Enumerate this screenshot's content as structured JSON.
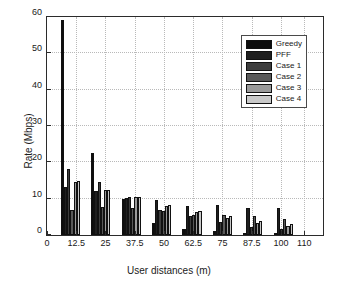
{
  "chart_data": {
    "type": "bar",
    "title": "",
    "xlabel": "User distances (m)",
    "ylabel": "Rate (Mbps)",
    "xlim": [
      0,
      118
    ],
    "ylim": [
      0,
      60
    ],
    "yticks": [
      0,
      10,
      20,
      30,
      40,
      50,
      60
    ],
    "xticks": [
      0,
      12.5,
      25,
      37.5,
      50,
      62.5,
      75,
      87.5,
      100,
      110
    ],
    "grid": true,
    "legend_position": "top-right",
    "group_centers": [
      10,
      23,
      36,
      49,
      62,
      75,
      88,
      101
    ],
    "categories": [
      "10",
      "23",
      "36",
      "49",
      "62",
      "75",
      "88",
      "101"
    ],
    "series": [
      {
        "name": "Greedy",
        "color": "#0d0d0d",
        "values": [
          59.2,
          22.5,
          9.9,
          3.3,
          1.6,
          1.1,
          0.6,
          0.3
        ]
      },
      {
        "name": "PFF",
        "color": "#1f1f1f",
        "values": [
          13.3,
          12.1,
          10.1,
          9.6,
          8.1,
          8.3,
          7.4,
          7.3
        ]
      },
      {
        "name": "Case 1",
        "color": "#3d3d3d",
        "values": [
          18.1,
          14.6,
          10.4,
          7.0,
          5.3,
          3.5,
          2.2,
          1.6
        ]
      },
      {
        "name": "Case 2",
        "color": "#595959",
        "values": [
          7.0,
          7.7,
          7.5,
          6.7,
          5.6,
          5.5,
          5.1,
          4.4
        ]
      },
      {
        "name": "Case 3",
        "color": "#9a9a9a",
        "values": [
          14.6,
          12.3,
          10.4,
          7.9,
          6.4,
          4.7,
          3.4,
          2.5
        ]
      },
      {
        "name": "Case 4",
        "color": "#c9c9c9",
        "values": [
          14.8,
          12.5,
          10.4,
          8.3,
          6.5,
          5.1,
          3.9,
          3.0
        ]
      }
    ]
  },
  "legend": {
    "items": [
      {
        "label": "Greedy"
      },
      {
        "label": "PFF"
      },
      {
        "label": "Case 1"
      },
      {
        "label": "Case 2"
      },
      {
        "label": "Case 3"
      },
      {
        "label": "Case 4"
      }
    ]
  },
  "axes": {
    "y_title": "Rate (Mbps)",
    "x_title": "User distances (m)",
    "y_tick_labels": [
      "0",
      "10",
      "20",
      "30",
      "40",
      "50",
      "60"
    ],
    "x_tick_labels": [
      "0",
      "12.5",
      "25",
      "37.5",
      "50",
      "62.5",
      "75",
      "87.5",
      "100",
      "110"
    ]
  }
}
